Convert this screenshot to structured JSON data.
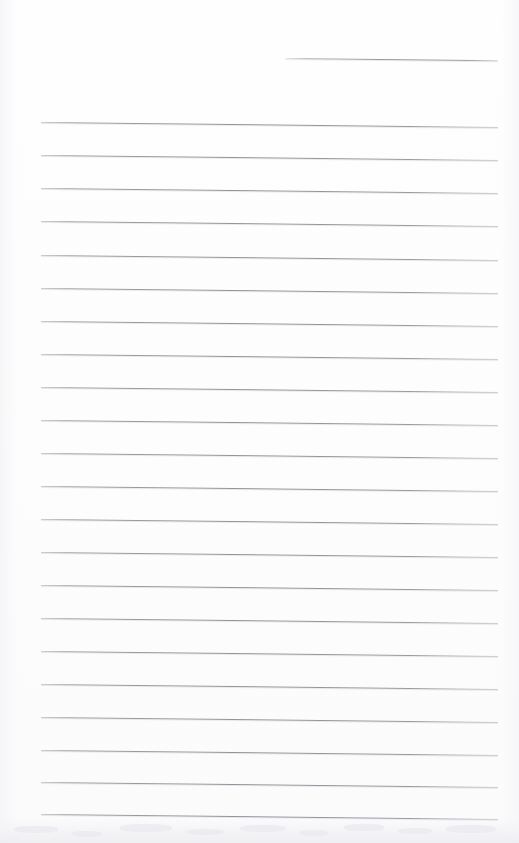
{
  "document": {
    "type": "scanned-ruled-notebook-page",
    "title": "",
    "body_text": "",
    "page_width": 519,
    "page_height": 843,
    "background_color": "#fdfdfd",
    "rule_color": "#92929a",
    "smudge_color": "#eeeef2"
  },
  "layout": {
    "rule_left_x": 41,
    "rule_right_x": 498,
    "partial_rule_left_x": 285,
    "first_rule_y": 58,
    "rule_spacing": 33.2,
    "rule_slope_px": 5
  },
  "ruled_lines": [
    {
      "index": 1,
      "y": 58,
      "x_start": 285,
      "x_end": 498,
      "partial": true
    },
    {
      "index": 2,
      "y": 122,
      "x_start": 41,
      "x_end": 498,
      "partial": false
    },
    {
      "index": 3,
      "y": 155,
      "x_start": 41,
      "x_end": 498,
      "partial": false
    },
    {
      "index": 4,
      "y": 188,
      "x_start": 41,
      "x_end": 498,
      "partial": false
    },
    {
      "index": 5,
      "y": 221,
      "x_start": 41,
      "x_end": 498,
      "partial": false
    },
    {
      "index": 6,
      "y": 255,
      "x_start": 41,
      "x_end": 498,
      "partial": false
    },
    {
      "index": 7,
      "y": 288,
      "x_start": 41,
      "x_end": 498,
      "partial": false
    },
    {
      "index": 8,
      "y": 321,
      "x_start": 41,
      "x_end": 498,
      "partial": false
    },
    {
      "index": 9,
      "y": 354,
      "x_start": 41,
      "x_end": 498,
      "partial": false
    },
    {
      "index": 10,
      "y": 387,
      "x_start": 41,
      "x_end": 498,
      "partial": false
    },
    {
      "index": 11,
      "y": 420,
      "x_start": 41,
      "x_end": 498,
      "partial": false
    },
    {
      "index": 12,
      "y": 453,
      "x_start": 41,
      "x_end": 498,
      "partial": false
    },
    {
      "index": 13,
      "y": 486,
      "x_start": 41,
      "x_end": 498,
      "partial": false
    },
    {
      "index": 14,
      "y": 519,
      "x_start": 41,
      "x_end": 498,
      "partial": false
    },
    {
      "index": 15,
      "y": 552,
      "x_start": 41,
      "x_end": 498,
      "partial": false
    },
    {
      "index": 16,
      "y": 585,
      "x_start": 41,
      "x_end": 498,
      "partial": false
    },
    {
      "index": 17,
      "y": 618,
      "x_start": 41,
      "x_end": 498,
      "partial": false
    },
    {
      "index": 18,
      "y": 651,
      "x_start": 41,
      "x_end": 498,
      "partial": false
    },
    {
      "index": 19,
      "y": 684,
      "x_start": 41,
      "x_end": 498,
      "partial": false
    },
    {
      "index": 20,
      "y": 717,
      "x_start": 41,
      "x_end": 498,
      "partial": false
    },
    {
      "index": 21,
      "y": 750,
      "x_start": 41,
      "x_end": 498,
      "partial": false
    },
    {
      "index": 22,
      "y": 782,
      "x_start": 41,
      "x_end": 498,
      "partial": false
    },
    {
      "index": 23,
      "y": 814,
      "x_start": 41,
      "x_end": 498,
      "partial": false
    }
  ],
  "artifacts": {
    "bottom_smudge": {
      "top": 818,
      "height": 25,
      "opacity": 0.9
    },
    "flecks": [
      {
        "x": 14,
        "y": 826,
        "w": 44,
        "h": 7
      },
      {
        "x": 72,
        "y": 831,
        "w": 30,
        "h": 6
      },
      {
        "x": 120,
        "y": 824,
        "w": 52,
        "h": 8
      },
      {
        "x": 186,
        "y": 829,
        "w": 38,
        "h": 6
      },
      {
        "x": 240,
        "y": 825,
        "w": 46,
        "h": 7
      },
      {
        "x": 300,
        "y": 830,
        "w": 28,
        "h": 6
      },
      {
        "x": 344,
        "y": 824,
        "w": 40,
        "h": 7
      },
      {
        "x": 398,
        "y": 828,
        "w": 34,
        "h": 6
      },
      {
        "x": 446,
        "y": 825,
        "w": 50,
        "h": 8
      }
    ]
  }
}
